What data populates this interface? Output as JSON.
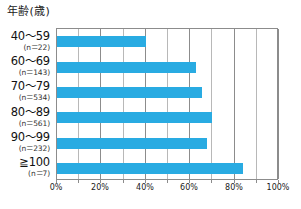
{
  "chart_data": {
    "type": "bar",
    "orientation": "horizontal",
    "title": "",
    "ylabel": "年齢(歳)",
    "xlabel": "",
    "categories": [
      "40〜59",
      "60〜69",
      "70〜79",
      "80〜89",
      "90〜99",
      "≧100"
    ],
    "category_counts": [
      "(n＝22)",
      "(n＝143)",
      "(n＝534)",
      "(n＝561)",
      "(n＝232)",
      "(n＝7)"
    ],
    "values": [
      40,
      62.5,
      65.5,
      70,
      67.5,
      84
    ],
    "xlim": [
      0,
      100
    ],
    "xticks": [
      0,
      20,
      40,
      60,
      80,
      100
    ],
    "xticklabels": [
      "0%",
      "20%",
      "40%",
      "60%",
      "80%",
      "100%"
    ],
    "minor_tick_step": 10,
    "grid": true,
    "legend": false,
    "bar_color": "#29abe2",
    "grid_color": "#b8b8b8",
    "axis_color": "#8c8c8c"
  },
  "axis_title": "年齢(歳)",
  "bars": [
    {
      "range": "40〜59",
      "count": "(n＝22)",
      "value": 40
    },
    {
      "range": "60〜69",
      "count": "(n＝143)",
      "value": 62.5
    },
    {
      "range": "70〜79",
      "count": "(n＝534)",
      "value": 65.5
    },
    {
      "range": "80〜89",
      "count": "(n＝561)",
      "value": 70
    },
    {
      "range": "90〜99",
      "count": "(n＝232)",
      "value": 67.5
    },
    {
      "range": "≧100",
      "count": "(n＝7)",
      "value": 84
    }
  ],
  "xticklabels": [
    "0%",
    "20%",
    "40%",
    "60%",
    "80%",
    "100%"
  ]
}
